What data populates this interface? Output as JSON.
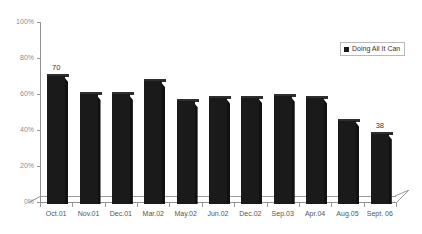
{
  "chart_data": {
    "type": "bar",
    "title": "",
    "xlabel": "",
    "ylabel": "",
    "ylim": [
      0,
      100
    ],
    "ytick_labels": [
      "0%",
      "20%",
      "40%",
      "60%",
      "80%",
      "100%"
    ],
    "ytick_values": [
      0,
      20,
      40,
      60,
      80,
      100
    ],
    "grid": false,
    "legend_position": "top-right",
    "categories": [
      "Oct.01",
      "Nov.01",
      "Dec.01",
      "Mar.02",
      "May.02",
      "Jun.02",
      "Dec.02",
      "Sep.03",
      "Apr.04",
      "Aug.05",
      "Sept. 06"
    ],
    "series": [
      {
        "name": "Doing All It Can",
        "values": [
          70,
          60,
          60,
          67,
          56,
          58,
          58,
          59,
          58,
          45,
          38
        ],
        "color": "#1a1a1a"
      }
    ],
    "data_labels": [
      {
        "category": "Oct.01",
        "value": 70,
        "text": "70"
      },
      {
        "category": "Sept. 06",
        "value": 38,
        "text": "38"
      }
    ]
  },
  "legend": {
    "entries": [
      {
        "label": "Doing All It Can",
        "color": "#1a1a1a",
        "marker": "square-marker"
      }
    ]
  },
  "axes": {
    "y": {
      "ticks": [
        {
          "label": "100%",
          "value": 100
        },
        {
          "label": "80%",
          "value": 80
        },
        {
          "label": "60%",
          "value": 60
        },
        {
          "label": "40%",
          "value": 40
        },
        {
          "label": "20%",
          "value": 20
        },
        {
          "label": "0%",
          "value": 0
        }
      ]
    },
    "x": {
      "ticks": [
        {
          "label": "Oct.01"
        },
        {
          "label": "Nov.01"
        },
        {
          "label": "Dec.01"
        },
        {
          "label": "Mar.02"
        },
        {
          "label": "May.02"
        },
        {
          "label": "Jun.02"
        },
        {
          "label": "Dec.02"
        },
        {
          "label": "Sep.03"
        },
        {
          "label": "Apr.04"
        },
        {
          "label": "Aug.05"
        },
        {
          "label": "Sept. 06"
        }
      ]
    }
  },
  "colors": {
    "bar": "#1a1a1a",
    "bar_top": "#2e2e2e",
    "axis": "#8f8f8f",
    "tick_text": "#8c8c8c",
    "category_text": "#555555",
    "background": "#ffffff"
  }
}
